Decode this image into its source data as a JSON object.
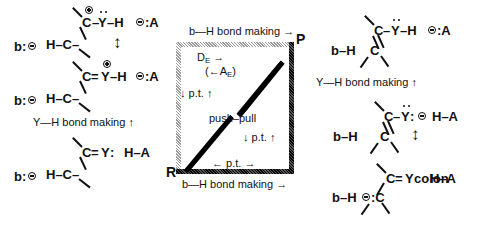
{
  "figure": {
    "type": "more-oferrall-jencks-diagram"
  },
  "square": {
    "corner_labels": {
      "top_right": "P",
      "bottom_left": "R"
    },
    "edges": {
      "top_label": "b—H bond making →",
      "bottom_label": "b—H bond making →",
      "left_label": "↓ p.t. ↑",
      "right_label": "↓ p.t. ↑",
      "inner_bottom_label": "← p.t. →"
    },
    "inner": {
      "de_label": "D",
      "de_sub": "E",
      "de_arrow": "→",
      "ae_label": "(←A",
      "ae_sub": "E",
      "ae_close": ")",
      "center_label": "push–pull"
    }
  },
  "left_column": {
    "top_structure": {
      "base": "b:",
      "base_charge": "minus",
      "line1_left": "H–C–",
      "upper_c": "C",
      "upper_c_charge": "plus",
      "upper_bond": "–",
      "y_atom": "Y",
      "y_lone_pair": "two-dots",
      "y_h": "–H",
      "counter_ion": ":A",
      "counter_ion_charge": "minus",
      "equilibrium_arrow": "↕"
    },
    "bottom_structure": {
      "base": "b:",
      "base_charge": "minus",
      "line1_left": "H–C–",
      "upper_c": "C",
      "upper_bond": "=",
      "y_atom": "Y",
      "y_charge": "plus",
      "y_h": "–H",
      "counter_ion": ":A",
      "counter_ion_charge": "minus"
    },
    "caption": "Y—H bond making ↑",
    "lower_structure": {
      "base": "b:",
      "base_charge": "minus",
      "line1_left": "H–C–",
      "upper_c": "C",
      "upper_bond": "=",
      "y_atom": "Y",
      "y_lone_pair": "two-dots-colon",
      "acid": "H–A"
    }
  },
  "right_column": {
    "top_structure": {
      "base": "b–H",
      "lower_c": "C",
      "upper_c": "C",
      "upper_bond": "–",
      "y_atom": "Y",
      "y_lone_pair": "two-dots",
      "y_h": "–H",
      "counter_ion": ":A",
      "counter_ion_charge": "minus"
    },
    "caption": "Y—H bond making ↑",
    "mid_structure": {
      "base": "b–H",
      "lower_c": "C",
      "upper_c": "C",
      "upper_bond": "–",
      "y_atom": "Y",
      "y_lone_pair": "two-dots",
      "y_colon": ":",
      "y_charge": "minus",
      "acid": "H–A",
      "equilibrium_arrow": "↕"
    },
    "bottom_structure": {
      "base": "b–H",
      "carbanion": ":C",
      "carbanion_charge": "minus",
      "upper_c": "C",
      "upper_bond": "=",
      "y_atom": "Y",
      "y_lone_pair": "colon",
      "acid": "H–A"
    }
  },
  "colors": {
    "ink": "#111111",
    "edge_light": "#b9b9b9",
    "edge_dark": "#1a1a1a",
    "background": "#ffffff"
  }
}
